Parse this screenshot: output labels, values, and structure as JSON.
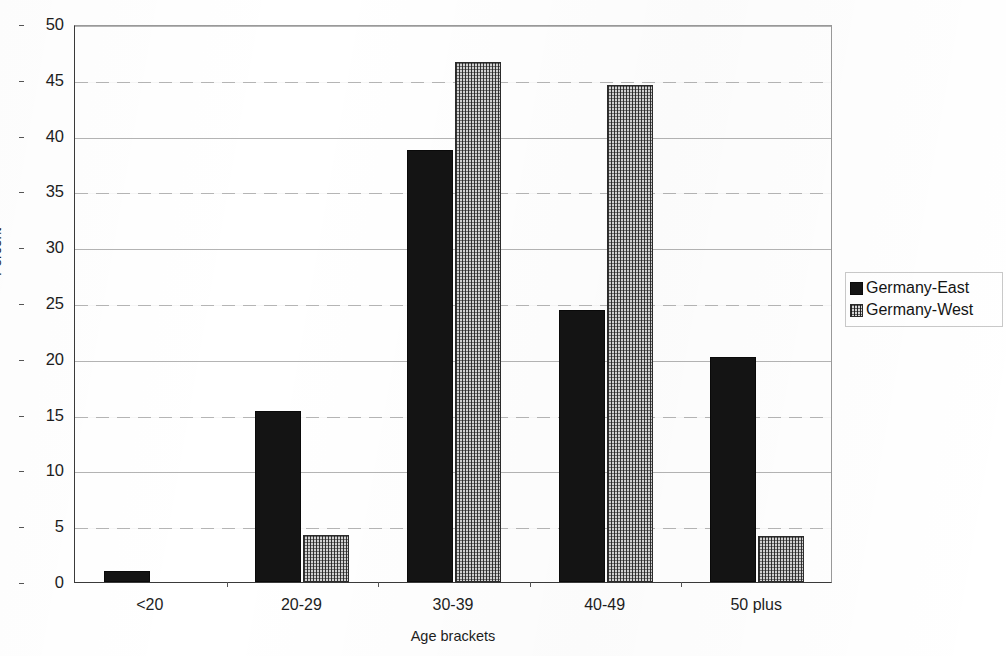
{
  "chart_data": {
    "type": "bar",
    "title": "",
    "categories": [
      "<20",
      "20-29",
      "30-39",
      "40-49",
      "50 plus"
    ],
    "series": [
      {
        "name": "Germany-East",
        "values": [
          1.0,
          15.3,
          38.7,
          24.4,
          20.2
        ],
        "color": "#141414",
        "pattern": "solid"
      },
      {
        "name": "Germany-West",
        "values": [
          0.0,
          4.2,
          46.6,
          44.5,
          4.1
        ],
        "color": "#d2d2d2",
        "pattern": "dotted"
      }
    ],
    "xlabel": "Age brackets",
    "ylabel": "Percent",
    "ylim": [
      0,
      50
    ],
    "yticks": [
      0,
      5,
      10,
      15,
      20,
      25,
      30,
      35,
      40,
      45,
      50
    ],
    "grid": true,
    "legend_position": "right"
  },
  "legend": {
    "items": [
      {
        "label": "Germany-East"
      },
      {
        "label": "Germany-West"
      }
    ]
  }
}
